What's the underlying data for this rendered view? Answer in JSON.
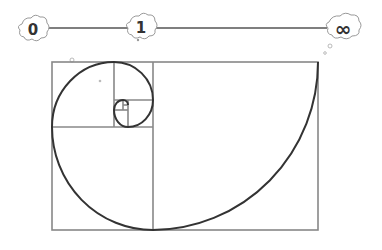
{
  "diagram": {
    "number_line": {
      "labels": [
        {
          "text": "0",
          "x": 33,
          "y": 30
        },
        {
          "text": "1",
          "x": 141,
          "y": 28
        },
        {
          "text": "∞",
          "x": 343,
          "y": 29
        }
      ],
      "line_color": "#555555"
    },
    "rectangle": {
      "x": 52,
      "y": 62,
      "width": 266,
      "height": 168,
      "stroke": "#888888"
    },
    "spiral": {
      "stroke": "#333333"
    }
  }
}
